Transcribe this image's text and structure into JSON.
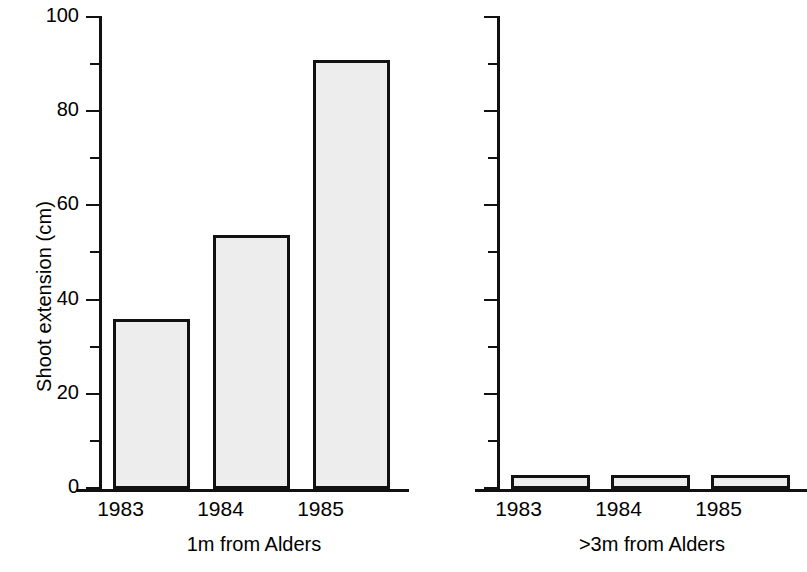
{
  "chart_data": {
    "type": "bar",
    "title": "",
    "subtitle": "",
    "xlabel": "",
    "ylabel": "Shoot extension (cm)",
    "ylim": [
      0,
      100
    ],
    "ytick_major": [
      0,
      20,
      40,
      60,
      80,
      100
    ],
    "ytick_minor": [
      10,
      30,
      50,
      70,
      90
    ],
    "ytick_labels": [
      "0",
      "20",
      "40",
      "60",
      "80",
      "100"
    ],
    "grid": false,
    "legend": false,
    "legend_position": "none",
    "bar_fill_color": "#ededed",
    "bar_edge_color": "#111111",
    "categories": [
      "1983",
      "1984",
      "1985"
    ],
    "panels": [
      {
        "name": "1m from Alders",
        "caption": "1m from Alders",
        "categories": [
          "1983",
          "1984",
          "1985"
        ],
        "values": [
          36,
          54,
          91
        ],
        "ylabel": "Shoot extension (cm)",
        "axis_labelled": true
      },
      {
        "name": ">3m from Alders",
        "caption": ">3m from Alders",
        "categories": [
          "1983",
          "1984",
          "1985"
        ],
        "values": [
          3,
          3,
          3
        ],
        "ylabel": "",
        "axis_labelled": false
      }
    ],
    "series": [
      {
        "name": "1m from Alders",
        "values": [
          36,
          54,
          91
        ]
      },
      {
        "name": ">3m from Alders",
        "values": [
          3,
          3,
          3
        ]
      }
    ]
  },
  "axis": {
    "y_title": "Shoot extension (cm)",
    "labels": {
      "t0": "0",
      "t20": "20",
      "t40": "40",
      "t60": "60",
      "t80": "80",
      "t100": "100"
    }
  },
  "panel_left": {
    "caption": "1m from Alders",
    "cat1": "1983",
    "cat2": "1984",
    "cat3": "1985"
  },
  "panel_right": {
    "caption": ">3m from Alders",
    "cat1": "1983",
    "cat2": "1984",
    "cat3": "1985"
  }
}
